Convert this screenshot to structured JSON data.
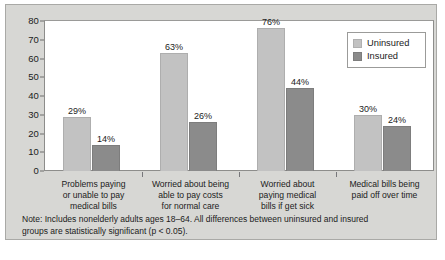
{
  "chart_data": {
    "type": "bar",
    "title": "",
    "xlabel": "",
    "ylabel": "",
    "ylim": [
      0,
      80
    ],
    "yticks": [
      "0",
      "10",
      "20",
      "30",
      "40",
      "50",
      "60",
      "70",
      "80"
    ],
    "grid": false,
    "legend_position": "top-right",
    "categories": [
      "Problems paying or unable to pay medical bills",
      "Worried about being able to pay costs for normal care",
      "Worried about paying medical bills if get sick",
      "Medical bills being paid off over time"
    ],
    "category_lines": [
      [
        "Problems paying",
        "or unable to pay",
        "medical bills"
      ],
      [
        "Worried about being",
        "able to pay costs",
        "for normal care"
      ],
      [
        "Worried about",
        "paying medical",
        "bills if get sick"
      ],
      [
        "Medical bills being",
        "paid off over time"
      ]
    ],
    "series": [
      {
        "name": "Uninsured",
        "color": "#c2c2c2",
        "values": [
          29,
          63,
          76,
          30
        ],
        "labels": [
          "29%",
          "63%",
          "76%",
          "30%"
        ]
      },
      {
        "name": "Insured",
        "color": "#8b8b8b",
        "values": [
          14,
          26,
          44,
          24
        ],
        "labels": [
          "14%",
          "26%",
          "44%",
          "24%"
        ]
      }
    ]
  },
  "legend": {
    "items": [
      {
        "label": "Uninsured",
        "color": "#c2c2c2"
      },
      {
        "label": "Insured",
        "color": "#8b8b8b"
      }
    ]
  },
  "note": {
    "line1": "Note: Includes nonelderly adults ages 18–64. All differences between uninsured and insured",
    "line2": "groups are statistically significant (p < 0.05)."
  },
  "colors": {
    "panel_background": "#d7d7d4",
    "plot_background": "#ffffff",
    "axis": "#8d8d8b",
    "text": "#1b1b1b"
  }
}
